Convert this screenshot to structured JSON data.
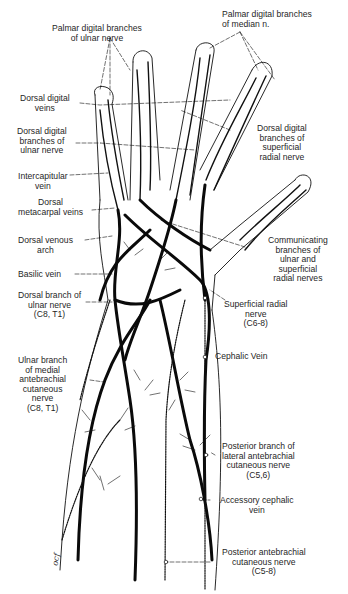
{
  "figure": {
    "signature": "ocf",
    "colors": {
      "ink": "#111111",
      "background": "#ffffff",
      "text": "#1f1f1f"
    }
  },
  "labels": {
    "palmar_ulnar": "Palmar digital branches\nof ulnar nerve",
    "palmar_median": "Palmar digital branches\nof median n.",
    "dorsal_digital_veins": "Dorsal digital\nveins",
    "dorsal_digital_ulnar": "Dorsal digital\nbranches of\nulnar nerve",
    "dorsal_digital_radial": "Dorsal digital\nbranches of\nsuperficial\nradial nerve",
    "intercapitular": "Intercapitular\nvein",
    "dorsal_metacarpal": "Dorsal\nmetacarpal veins",
    "dorsal_venous_arch": "Dorsal venous\narch",
    "communicating": "Communicating\nbranches of\nulnar and\nsuperficial\nradial nerves",
    "basilic": "Basilic vein",
    "dorsal_branch_ulnar": "Dorsal branch of\nulnar nerve\n(C8, T1)",
    "superficial_radial": "Superficial radial\nnerve\n(C6-8)",
    "cephalic": "Cephalic Vein",
    "ulnar_branch_medial": "Ulnar branch\nof medial\nantebrachial\ncutaneous\nnerve\n(C8, T1)",
    "posterior_lateral": "Posterior branch of\nlateral antebrachial\ncutaneous nerve\n(C5,6)",
    "accessory_cephalic": "Accessory cephalic\nvein",
    "posterior_antebrachial": "Posterior antebrachial\ncutaneous nerve\n(C5-8)"
  }
}
